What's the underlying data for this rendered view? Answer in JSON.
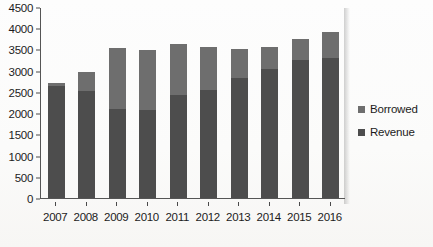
{
  "chart_data": {
    "type": "bar",
    "subtype": "stacked-bar",
    "title": "",
    "xlabel": "",
    "ylabel": "",
    "ylim": [
      0,
      4500
    ],
    "ytick_step": 500,
    "yticks": [
      0,
      500,
      1000,
      1500,
      2000,
      2500,
      3000,
      3500,
      4000,
      4500
    ],
    "ytick_labels": [
      "0",
      "500",
      "1000",
      "1500",
      "2000",
      "2500",
      "3000",
      "3500",
      "4000",
      "4500"
    ],
    "categories": [
      "2007",
      "2008",
      "2009",
      "2010",
      "2011",
      "2012",
      "2013",
      "2014",
      "2015",
      "2016"
    ],
    "grid": false,
    "legend_position": "right",
    "series": [
      {
        "name": "Revenue",
        "color": "#4d4d4d",
        "values": [
          2650,
          2520,
          2100,
          2080,
          2420,
          2540,
          2830,
          3030,
          3250,
          3300
        ]
      },
      {
        "name": "Borrowed",
        "color": "#6e6e6e",
        "values": [
          70,
          460,
          1430,
          1400,
          1200,
          1020,
          680,
          530,
          500,
          600
        ]
      }
    ],
    "stack_order_bottom_to_top": [
      "Revenue",
      "Borrowed"
    ],
    "totals": [
      2720,
      2980,
      3530,
      3480,
      3620,
      3560,
      3510,
      3560,
      3750,
      3900
    ]
  },
  "legend": {
    "items": [
      {
        "label": "Borrowed",
        "color": "#6e6e6e"
      },
      {
        "label": "Revenue",
        "color": "#4d4d4d"
      }
    ]
  },
  "colors": {
    "axis": "#555555",
    "text": "#1c1c1c",
    "background": "#fdfdfd"
  }
}
